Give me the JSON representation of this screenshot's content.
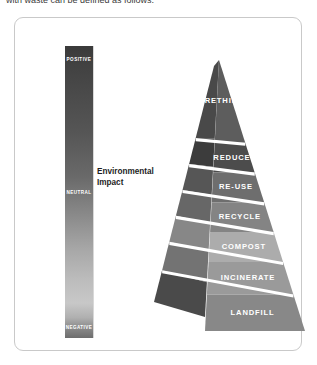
{
  "top_caption": "with waste can be defined as follows:",
  "figure": {
    "impact_scale": {
      "name": "environmental-impact-scale",
      "caption_line1": "Environmental",
      "caption_line2": "Impact",
      "labels": {
        "top": "POSITIVE",
        "middle": "NEUTRAL",
        "bottom": "NEGATIVE"
      },
      "gradient_top_color": "#3a3a3a",
      "gradient_mid_color": "#8a8a8a",
      "gradient_bottom_color": "#c8c8c8"
    },
    "pyramid": {
      "name": "waste-hierarchy-pyramid",
      "tiers": [
        {
          "label": "RETHINK",
          "front_color": "#5d5d5d",
          "side_color": "#494949"
        },
        {
          "label": "REDUCE",
          "front_color": "#4c4c4c",
          "side_color": "#3c3c3c"
        },
        {
          "label": "RE-USE",
          "front_color": "#6e6e6e",
          "side_color": "#565656"
        },
        {
          "label": "RECYCLE",
          "front_color": "#848484",
          "side_color": "#676767"
        },
        {
          "label": "COMPOST",
          "front_color": "#acacac",
          "side_color": "#878787"
        },
        {
          "label": "INCINERATE",
          "front_color": "#9a9a9a",
          "side_color": "#737373"
        },
        {
          "label": "LANDFILL",
          "front_color": "#888888",
          "side_color": "#4a4a4a"
        }
      ]
    },
    "frame_border_color": "#c9c9c9"
  }
}
